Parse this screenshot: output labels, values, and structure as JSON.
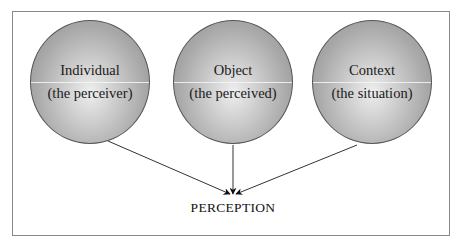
{
  "diagram": {
    "nodes": [
      {
        "id": "individual",
        "title": "Individual",
        "subtitle": "(the perceiver)"
      },
      {
        "id": "object",
        "title": "Object",
        "subtitle": "(the perceived)"
      },
      {
        "id": "context",
        "title": "Context",
        "subtitle": "(the situation)"
      }
    ],
    "result": "PERCEPTION",
    "edges": [
      {
        "from": "individual",
        "to": "PERCEPTION"
      },
      {
        "from": "object",
        "to": "PERCEPTION"
      },
      {
        "from": "context",
        "to": "PERCEPTION"
      }
    ],
    "colors": {
      "circle_fill": "#b0b0b0",
      "circle_highlight": "#eeeeee",
      "line": "#333333",
      "frame": "#8a8a8a"
    }
  }
}
